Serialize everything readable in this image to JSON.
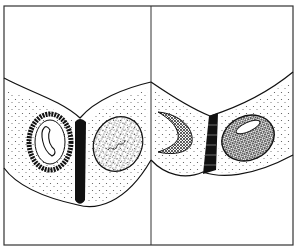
{
  "figure": {
    "type": "biological-line-drawing",
    "panels": [
      {
        "id": "left",
        "cells": [
          "cell-with-banana-nucleus",
          "cell-with-speckled-nucleus"
        ],
        "junction": "dark-cell-junction"
      },
      {
        "id": "right",
        "cells": [
          "cell-with-crescent-nucleus",
          "cell-with-dense-oval-nucleus"
        ],
        "junction": "dark-cell-junction"
      }
    ],
    "colors": {
      "ink": "#111111",
      "background": "#ffffff"
    }
  }
}
